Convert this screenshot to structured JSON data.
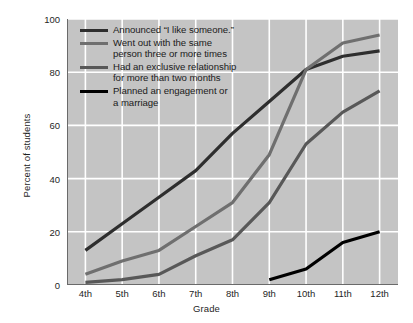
{
  "chart_data": {
    "type": "line",
    "title": "",
    "xlabel": "Grade",
    "ylabel": "Percent of students",
    "categories": [
      "4th",
      "5th",
      "6th",
      "7th",
      "8th",
      "9th",
      "10th",
      "11th",
      "12th"
    ],
    "ylim": [
      0,
      100
    ],
    "yticks": [
      0,
      20,
      40,
      60,
      80,
      100
    ],
    "grid": true,
    "legend_position": "upper-left-inside",
    "plot_background": "#c4c4c4",
    "gridline_color": "#ffffff",
    "series": [
      {
        "name": "Announced “I like someone.”",
        "color": "#2e2e2e",
        "values": [
          13,
          23,
          33,
          43,
          57,
          69,
          81,
          86,
          88
        ]
      },
      {
        "name": "Went out with the same person three or more times",
        "color": "#6f6f6f",
        "values": [
          4,
          9,
          13,
          22,
          31,
          49,
          81,
          91,
          94
        ]
      },
      {
        "name": "Had an exclusive relationship for more than two months",
        "color": "#585858",
        "values": [
          1,
          2,
          4,
          11,
          17,
          31,
          53,
          65,
          73
        ]
      },
      {
        "name": "Planned an engagement or a marriage",
        "color": "#000000",
        "values": [
          null,
          null,
          null,
          null,
          null,
          2,
          6,
          16,
          20
        ]
      }
    ]
  },
  "legend": {
    "items": [
      {
        "label_line1": "Announced “I like someone.”",
        "label_line2": "",
        "color": "#2e2e2e"
      },
      {
        "label_line1": "Went out with the same",
        "label_line2": "person three or more times",
        "color": "#6f6f6f"
      },
      {
        "label_line1": "Had an exclusive relationship",
        "label_line2": "for more than two months",
        "color": "#585858"
      },
      {
        "label_line1": "Planned an engagement or",
        "label_line2": "a marriage",
        "color": "#000000"
      }
    ]
  },
  "axes": {
    "y_label": "Percent of students",
    "x_label": "Grade",
    "y_tick_labels": [
      "0",
      "20",
      "40",
      "60",
      "80",
      "100"
    ],
    "x_tick_labels": [
      "4th",
      "5th",
      "6th",
      "7th",
      "8th",
      "9th",
      "10th",
      "11th",
      "12th"
    ]
  }
}
